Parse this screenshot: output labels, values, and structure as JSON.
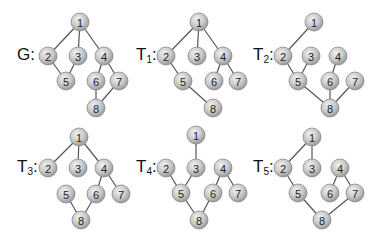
{
  "node_radius": 9,
  "colors": {
    "node_fill": "#c8c8c8",
    "node_stroke": "#888888",
    "edge": "#555555",
    "text": "#222222"
  },
  "graphs": [
    {
      "id": "G",
      "label": "G",
      "subscript": "",
      "suffix": ":",
      "label_pos": [
        17,
        60
      ],
      "nodes": [
        {
          "id": "1",
          "x": 80,
          "y": 22
        },
        {
          "id": "2",
          "x": 48,
          "y": 56
        },
        {
          "id": "3",
          "x": 78,
          "y": 56
        },
        {
          "id": "4",
          "x": 104,
          "y": 56
        },
        {
          "id": "5",
          "x": 66,
          "y": 81
        },
        {
          "id": "6",
          "x": 96,
          "y": 81
        },
        {
          "id": "7",
          "x": 119,
          "y": 81
        },
        {
          "id": "8",
          "x": 96,
          "y": 108
        }
      ],
      "edges": [
        [
          "1",
          "2"
        ],
        [
          "1",
          "3"
        ],
        [
          "1",
          "4"
        ],
        [
          "2",
          "5"
        ],
        [
          "3",
          "5"
        ],
        [
          "4",
          "6"
        ],
        [
          "4",
          "7"
        ],
        [
          "6",
          "8"
        ],
        [
          "7",
          "8"
        ]
      ]
    },
    {
      "id": "T1",
      "label": "T",
      "subscript": "1",
      "suffix": ":",
      "label_pos": [
        136,
        60
      ],
      "nodes": [
        {
          "id": "1",
          "x": 199,
          "y": 22
        },
        {
          "id": "2",
          "x": 166,
          "y": 56
        },
        {
          "id": "3",
          "x": 197,
          "y": 56
        },
        {
          "id": "4",
          "x": 223,
          "y": 56
        },
        {
          "id": "5",
          "x": 183,
          "y": 81
        },
        {
          "id": "6",
          "x": 214,
          "y": 81
        },
        {
          "id": "7",
          "x": 238,
          "y": 81
        },
        {
          "id": "8",
          "x": 213,
          "y": 108
        }
      ],
      "edges": [
        [
          "1",
          "2"
        ],
        [
          "1",
          "3"
        ],
        [
          "1",
          "4"
        ],
        [
          "2",
          "5"
        ],
        [
          "5",
          "8"
        ],
        [
          "4",
          "6"
        ],
        [
          "4",
          "7"
        ]
      ]
    },
    {
      "id": "T2",
      "label": "T",
      "subscript": "2",
      "suffix": ":",
      "label_pos": [
        253,
        60
      ],
      "nodes": [
        {
          "id": "1",
          "x": 314,
          "y": 22
        },
        {
          "id": "2",
          "x": 283,
          "y": 56
        },
        {
          "id": "3",
          "x": 311,
          "y": 56
        },
        {
          "id": "4",
          "x": 338,
          "y": 56
        },
        {
          "id": "5",
          "x": 298,
          "y": 81
        },
        {
          "id": "6",
          "x": 330,
          "y": 81
        },
        {
          "id": "7",
          "x": 355,
          "y": 81
        },
        {
          "id": "8",
          "x": 330,
          "y": 108
        }
      ],
      "edges": [
        [
          "1",
          "2"
        ],
        [
          "2",
          "5"
        ],
        [
          "3",
          "5"
        ],
        [
          "5",
          "8"
        ],
        [
          "4",
          "6"
        ],
        [
          "6",
          "8"
        ],
        [
          "7",
          "8"
        ]
      ]
    },
    {
      "id": "T3",
      "label": "T",
      "subscript": "3",
      "suffix": ":",
      "label_pos": [
        17,
        172
      ],
      "nodes": [
        {
          "id": "1",
          "x": 79,
          "y": 137
        },
        {
          "id": "2",
          "x": 48,
          "y": 168
        },
        {
          "id": "3",
          "x": 78,
          "y": 168
        },
        {
          "id": "4",
          "x": 104,
          "y": 168
        },
        {
          "id": "5",
          "x": 66,
          "y": 194
        },
        {
          "id": "6",
          "x": 96,
          "y": 194
        },
        {
          "id": "7",
          "x": 121,
          "y": 194
        },
        {
          "id": "8",
          "x": 81,
          "y": 220
        }
      ],
      "edges": [
        [
          "1",
          "2"
        ],
        [
          "1",
          "3"
        ],
        [
          "1",
          "4"
        ],
        [
          "4",
          "6"
        ],
        [
          "4",
          "7"
        ],
        [
          "5",
          "8"
        ],
        [
          "6",
          "8"
        ]
      ]
    },
    {
      "id": "T4",
      "label": "T",
      "subscript": "4",
      "suffix": ":",
      "label_pos": [
        136,
        172
      ],
      "nodes": [
        {
          "id": "1",
          "x": 196,
          "y": 135
        },
        {
          "id": "2",
          "x": 166,
          "y": 168
        },
        {
          "id": "3",
          "x": 196,
          "y": 168
        },
        {
          "id": "4",
          "x": 223,
          "y": 168
        },
        {
          "id": "5",
          "x": 181,
          "y": 193
        },
        {
          "id": "6",
          "x": 213,
          "y": 193
        },
        {
          "id": "7",
          "x": 238,
          "y": 193
        },
        {
          "id": "8",
          "x": 199,
          "y": 220
        }
      ],
      "edges": [
        [
          "1",
          "3"
        ],
        [
          "2",
          "5"
        ],
        [
          "3",
          "5"
        ],
        [
          "5",
          "8"
        ],
        [
          "6",
          "8"
        ],
        [
          "4",
          "6"
        ],
        [
          "4",
          "7"
        ]
      ]
    },
    {
      "id": "T5",
      "label": "T",
      "subscript": "5",
      "suffix": ":",
      "label_pos": [
        253,
        172
      ],
      "nodes": [
        {
          "id": "1",
          "x": 312,
          "y": 137
        },
        {
          "id": "2",
          "x": 283,
          "y": 168
        },
        {
          "id": "3",
          "x": 312,
          "y": 168
        },
        {
          "id": "4",
          "x": 340,
          "y": 168
        },
        {
          "id": "5",
          "x": 298,
          "y": 193
        },
        {
          "id": "6",
          "x": 330,
          "y": 193
        },
        {
          "id": "7",
          "x": 355,
          "y": 193
        },
        {
          "id": "8",
          "x": 322,
          "y": 220
        }
      ],
      "edges": [
        [
          "1",
          "2"
        ],
        [
          "1",
          "3"
        ],
        [
          "2",
          "5"
        ],
        [
          "5",
          "8"
        ],
        [
          "7",
          "8"
        ],
        [
          "4",
          "6"
        ],
        [
          "4",
          "7"
        ]
      ]
    }
  ]
}
